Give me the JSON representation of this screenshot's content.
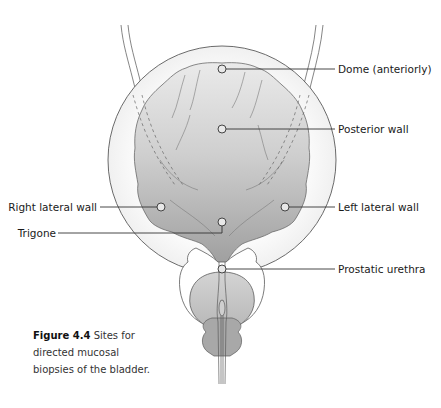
{
  "figure": {
    "number_label": "Figure 4.4",
    "caption_text": "Sites for directed mucosal biopsies of the bladder.",
    "caption_lines": [
      "Sites for",
      "directed mucosal",
      "biopsies of the bladder."
    ]
  },
  "labels": {
    "dome": "Dome (anteriorly)",
    "posterior_wall": "Posterior wall",
    "right_lateral_wall": "Right lateral wall",
    "left_lateral_wall": "Left lateral wall",
    "trigone": "Trigone",
    "prostatic_urethra": "Prostatic urethra"
  },
  "colors": {
    "outline": "#555555",
    "bladder_fill_light": "#eeeeee",
    "bladder_fill_dark": "#a9a9a9",
    "prostate_fill": "#c6c6c6",
    "leader_line": "#333333"
  }
}
